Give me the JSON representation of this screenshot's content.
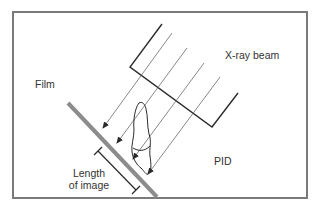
{
  "diagram": {
    "labels": {
      "film": "Film",
      "xray_beam": "X-ray beam",
      "pid": "PID",
      "length_line1": "Length",
      "length_line2": "of image"
    },
    "colors": {
      "frame": "#7a7a7a",
      "film": "#8c8c8c",
      "pid_outline": "#2a2a2a",
      "beam": "#6a6a6a",
      "tooth": "#2a2a2a",
      "text": "#333333",
      "background": "#ffffff"
    }
  }
}
